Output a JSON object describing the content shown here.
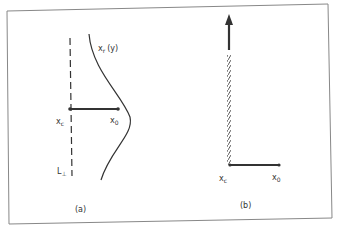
{
  "panels": {
    "a": {
      "caption": "(a)",
      "curve_label": "x",
      "curve_label_sub": "r",
      "curve_label_arg": "(y)",
      "xc_label": "x",
      "xc_sub": "c",
      "x0_label": "x",
      "x0_sub": "0",
      "line_label": "L",
      "line_label_sub": "⊥"
    },
    "b": {
      "caption": "(b)",
      "xc_label": "x",
      "xc_sub": "c",
      "x0_label": "x",
      "x0_sub": "0"
    }
  },
  "colors": {
    "ink": "#333333",
    "frame": "#888888"
  }
}
